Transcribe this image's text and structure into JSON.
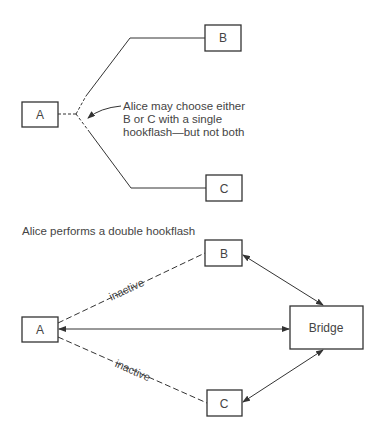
{
  "top_diagram": {
    "nodes": {
      "a": "A",
      "b": "B",
      "c": "C"
    },
    "annotation": [
      "Alice may choose either",
      "B or C with a single",
      "hookflash—but not both"
    ]
  },
  "bottom_diagram": {
    "title": "Alice performs a double hookflash",
    "nodes": {
      "a": "A",
      "b": "B",
      "c": "C",
      "bridge": "Bridge"
    },
    "edge_labels": {
      "a_b": "inactive",
      "a_c": "inactive"
    }
  }
}
